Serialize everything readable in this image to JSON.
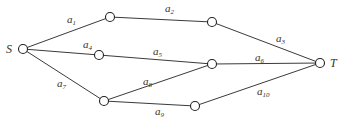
{
  "diagram": {
    "type": "network-graph",
    "terminals": {
      "source": "S",
      "sink": "T"
    },
    "nodes": [
      {
        "id": "S",
        "label": "S",
        "x": 23,
        "y": 49
      },
      {
        "id": "n1",
        "label": "",
        "x": 110,
        "y": 17
      },
      {
        "id": "n2",
        "label": "",
        "x": 99,
        "y": 55
      },
      {
        "id": "n3",
        "label": "",
        "x": 104,
        "y": 101
      },
      {
        "id": "n4",
        "label": "",
        "x": 212,
        "y": 22
      },
      {
        "id": "n5",
        "label": "",
        "x": 212,
        "y": 64
      },
      {
        "id": "n6",
        "label": "",
        "x": 195,
        "y": 106
      },
      {
        "id": "T",
        "label": "T",
        "x": 320,
        "y": 63
      }
    ],
    "edges": [
      {
        "id": "a1",
        "base": "a",
        "sub": "1",
        "from": "S",
        "to": "n1",
        "lx": 67,
        "ly": 23
      },
      {
        "id": "a2",
        "base": "a",
        "sub": "2",
        "from": "n1",
        "to": "n4",
        "lx": 165,
        "ly": 12
      },
      {
        "id": "a3",
        "base": "a",
        "sub": "3",
        "from": "n4",
        "to": "T",
        "lx": 276,
        "ly": 42
      },
      {
        "id": "a4",
        "base": "a",
        "sub": "4",
        "from": "S",
        "to": "n2",
        "lx": 83,
        "ly": 48
      },
      {
        "id": "a5",
        "base": "a",
        "sub": "5",
        "from": "n2",
        "to": "n5",
        "lx": 153,
        "ly": 55
      },
      {
        "id": "a6",
        "base": "a",
        "sub": "6",
        "from": "n5",
        "to": "T",
        "lx": 255,
        "ly": 61
      },
      {
        "id": "a7",
        "base": "a",
        "sub": "7",
        "from": "S",
        "to": "n3",
        "lx": 57,
        "ly": 87
      },
      {
        "id": "a8",
        "base": "a",
        "sub": "8",
        "from": "n3",
        "to": "n5",
        "lx": 143,
        "ly": 85
      },
      {
        "id": "a9",
        "base": "a",
        "sub": "9",
        "from": "n3",
        "to": "n6",
        "lx": 155,
        "ly": 115
      },
      {
        "id": "a10",
        "base": "a",
        "sub": "10",
        "from": "n6",
        "to": "T",
        "lx": 257,
        "ly": 95
      }
    ]
  }
}
